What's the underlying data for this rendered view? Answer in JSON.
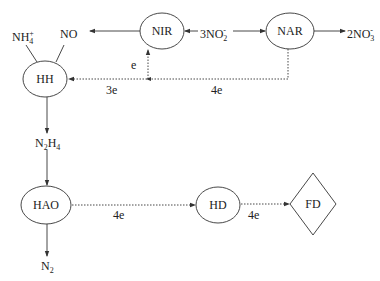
{
  "nodes": {
    "nir": {
      "label": "NIR",
      "shape": "ellipse"
    },
    "nar": {
      "label": "NAR",
      "shape": "ellipse"
    },
    "hh": {
      "label": "HH",
      "shape": "ellipse"
    },
    "hao": {
      "label": "HAO",
      "shape": "ellipse"
    },
    "hd": {
      "label": "HD",
      "shape": "ellipse"
    },
    "fd": {
      "label": "FD",
      "shape": "diamond"
    }
  },
  "species": {
    "nh4": {
      "base": "NH",
      "sub": "4",
      "sup": "+"
    },
    "no": {
      "base": "NO"
    },
    "no2": {
      "coef": "3",
      "base": "NO",
      "sub": "2",
      "sup": "-"
    },
    "no3": {
      "coef": "2",
      "base": "NO",
      "sub": "3",
      "sup": "-"
    },
    "n2h4": {
      "n": "N",
      "sub1": "2",
      "h": "H",
      "sub2": "4"
    },
    "n2": {
      "base": "N",
      "sub": "2"
    }
  },
  "electron_labels": {
    "to_nir": "e",
    "to_hh": "3e",
    "from_nar": "4e",
    "hao_to_hd": "4e",
    "hd_to_fd": "4e"
  },
  "edges": [
    {
      "from": "NIR",
      "to": "NO",
      "style": "solid"
    },
    {
      "from": "3NO2-",
      "to": "NIR",
      "style": "solid"
    },
    {
      "from": "3NO2-",
      "to": "NAR",
      "style": "solid"
    },
    {
      "from": "NAR",
      "to": "2NO3-",
      "style": "solid"
    },
    {
      "from": "NAR",
      "to": "HH",
      "style": "dotted",
      "label": "4e / 3e"
    },
    {
      "from": "junction",
      "to": "NIR",
      "style": "dotted",
      "label": "e"
    },
    {
      "from": "HH",
      "to": "NH4+",
      "style": "solid"
    },
    {
      "from": "HH",
      "to": "NO",
      "style": "solid"
    },
    {
      "from": "HH",
      "to": "N2H4",
      "style": "solid"
    },
    {
      "from": "N2H4",
      "to": "HAO",
      "style": "solid"
    },
    {
      "from": "HAO",
      "to": "N2",
      "style": "solid"
    },
    {
      "from": "HAO",
      "to": "HD",
      "style": "dotted",
      "label": "4e"
    },
    {
      "from": "HD",
      "to": "FD",
      "style": "dotted",
      "label": "4e"
    }
  ],
  "colors": {
    "stroke": "#333333",
    "text": "#222222",
    "background": "#ffffff"
  }
}
